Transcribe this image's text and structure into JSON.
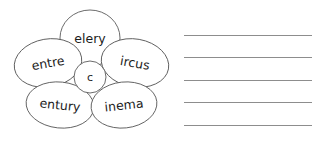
{
  "worksheet": {
    "title": "Word family flower with writing lines",
    "background_color": "#ffffff",
    "stroke_color": "#5a5a5a",
    "line_color": "#8d8d8d",
    "text_color": "#1c1c1c"
  },
  "flower": {
    "center": {
      "label": "c",
      "cx": 90,
      "cy": 77,
      "r": 16
    },
    "petals": [
      {
        "id": "petal-top",
        "label": "elery",
        "word": "celery",
        "cx": 90,
        "cy": 38,
        "rx": 30,
        "ry": 28,
        "rotate": 0
      },
      {
        "id": "petal-left",
        "label": "entre",
        "word": "centre",
        "cx": 48,
        "cy": 63,
        "rx": 34,
        "ry": 24,
        "rotate": -10
      },
      {
        "id": "petal-right",
        "label": "ircus",
        "word": "circus",
        "cx": 135,
        "cy": 63,
        "rx": 34,
        "ry": 24,
        "rotate": 10
      },
      {
        "id": "petal-bottom-left",
        "label": "entury",
        "word": "century",
        "cx": 60,
        "cy": 105,
        "rx": 34,
        "ry": 23,
        "rotate": 6
      },
      {
        "id": "petal-bottom-right",
        "label": "inema",
        "word": "cinema",
        "cx": 124,
        "cy": 105,
        "rx": 33,
        "ry": 23,
        "rotate": -6
      }
    ]
  },
  "writing_lines": {
    "count": 5,
    "left": 184,
    "right": 311,
    "length": 128,
    "y_positions": [
      35,
      57,
      80,
      102,
      125
    ]
  }
}
